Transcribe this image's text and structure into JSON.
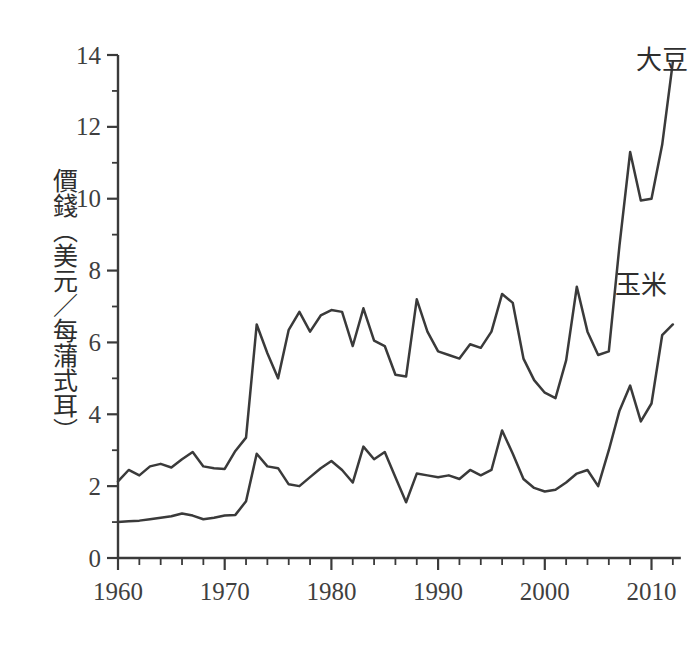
{
  "chart_data": {
    "type": "line",
    "title": "",
    "subtitle": "",
    "xlabel": "",
    "ylabel": "價錢（美元／每蒲式耳）",
    "xlim": [
      1960,
      2012
    ],
    "ylim": [
      0,
      14
    ],
    "grid": false,
    "legend_position": "inline-right",
    "x_ticks_major": [
      1960,
      1970,
      1980,
      1990,
      2000,
      2010
    ],
    "x_tick_labels": [
      "1960",
      "1970",
      "1980",
      "1990",
      "2000",
      "2010"
    ],
    "x_tick_minor_step": 2,
    "y_ticks_major": [
      0,
      2,
      4,
      6,
      8,
      10,
      12,
      14
    ],
    "y_tick_labels": [
      "0",
      "2",
      "4",
      "6",
      "8",
      "10",
      "12",
      "14"
    ],
    "y_tick_minor_step": 1,
    "line_color": "#3a3a3a",
    "background_color": "#ffffff",
    "x": [
      1960,
      1961,
      1962,
      1963,
      1964,
      1965,
      1966,
      1967,
      1968,
      1969,
      1970,
      1971,
      1972,
      1973,
      1974,
      1975,
      1976,
      1977,
      1978,
      1979,
      1980,
      1981,
      1982,
      1983,
      1984,
      1985,
      1986,
      1987,
      1988,
      1989,
      1990,
      1991,
      1992,
      1993,
      1994,
      1995,
      1996,
      1997,
      1998,
      1999,
      2000,
      2001,
      2002,
      2003,
      2004,
      2005,
      2006,
      2007,
      2008,
      2009,
      2010,
      2011,
      2012
    ],
    "series": [
      {
        "name": "大豆",
        "label": "大豆",
        "label_anchor_year": 2011,
        "label_anchor_value": 13.6,
        "values": [
          2.13,
          2.45,
          2.3,
          2.55,
          2.62,
          2.52,
          2.75,
          2.95,
          2.55,
          2.5,
          2.48,
          2.98,
          3.35,
          6.5,
          5.7,
          5.0,
          6.35,
          6.85,
          6.3,
          6.75,
          6.9,
          6.85,
          5.9,
          6.95,
          6.05,
          5.9,
          5.1,
          5.05,
          7.2,
          6.3,
          5.75,
          5.65,
          5.55,
          5.95,
          5.85,
          6.3,
          7.35,
          7.1,
          5.55,
          4.95,
          4.6,
          4.45,
          5.5,
          7.55,
          6.3,
          5.65,
          5.75,
          8.7,
          11.3,
          9.95,
          10.0,
          11.5,
          13.8
        ]
      },
      {
        "name": "玉米",
        "label": "玉米",
        "label_anchor_year": 2009,
        "label_anchor_value": 7.35,
        "values": [
          1.0,
          1.02,
          1.04,
          1.08,
          1.12,
          1.16,
          1.24,
          1.18,
          1.08,
          1.12,
          1.18,
          1.2,
          1.58,
          2.9,
          2.55,
          2.5,
          2.05,
          2.0,
          2.25,
          2.5,
          2.7,
          2.45,
          2.1,
          3.1,
          2.75,
          2.95,
          2.25,
          1.55,
          2.35,
          2.3,
          2.25,
          2.3,
          2.2,
          2.45,
          2.3,
          2.45,
          3.55,
          2.9,
          2.2,
          1.95,
          1.85,
          1.9,
          2.1,
          2.35,
          2.45,
          2.0,
          3.0,
          4.1,
          4.8,
          3.8,
          4.3,
          6.2,
          6.5
        ]
      }
    ]
  }
}
